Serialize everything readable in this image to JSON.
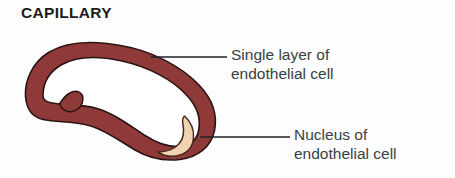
{
  "figure": {
    "title": "CAPILLARY",
    "width": 455,
    "height": 178,
    "background_color": "#fdfdfd"
  },
  "colors": {
    "wall": "#8f3a38",
    "wall_outline": "#2a1413",
    "lumen": "#ffffff",
    "nucleus": "#efd3b2",
    "nucleus_outline": "#4a2a1c",
    "leader_line": "#1d2127",
    "title_text": "#1b1b1b",
    "label_text": "#3a3f44"
  },
  "labels": {
    "single_layer": {
      "line1": "Single layer of",
      "line2": "endothelial cell"
    },
    "nucleus": {
      "line1": "Nucleus of",
      "line2": "endothelial cell"
    }
  },
  "leaders": {
    "single_layer": {
      "x1": 151,
      "y1": 57,
      "x2": 227,
      "y2": 57
    },
    "nucleus": {
      "x1": 200,
      "y1": 137,
      "x2": 290,
      "y2": 137
    }
  },
  "shapes": {
    "capillary_outer_path": "M 25.5 96.5 C 24.5 80.5 32.5 62.5 48.5 52.5 C 66.5 41.5 92.5 40.5 120.5 45.5 C 150.5 50.5 180.5 65.5 199.5 85.5 C 212.5 99.5 217.5 115.5 214.5 130.5 C 211.0 147.0 197.5 157.5 180.0 159.5 C 163.0 161.5 147.0 157.0 135.0 150.0 C 120.0 141.0 106.5 131.0 91.0 126.0 C 76.0 121.0 58.0 122.5 43.0 119.5 C 31.5 117.0 26.5 108.0 25.5 96.5 Z",
    "capillary_lumen_path": "M 43.0 95.5 C 43.0 82.5 49.5 71.5 62.0 64.5 C 77.0 56.0 99.0 56.0 122.0 61.0 C 147.0 66.5 172.0 79.0 187.0 95.5 C 197.5 107.0 201.0 119.5 198.5 131.0 C 196.5 140.5 189.5 146.0 179.0 146.5 C 167.0 147.0 155.0 142.0 145.0 135.5 C 129.0 125.0 114.0 113.5 97.0 108.5 C 84.0 104.5 70.5 105.0 59.5 104.0 C 49.0 103.0 43.0 101.5 43.0 95.5 Z",
    "capillary_notch_path": "M 59.5 104.0 C 62.0 100.0 65.0 96.0 69.0 93.5 C 73.0 91.0 77.5 90.5 80.5 93.0 C 83.0 95.0 83.5 99.0 82.0 103.5 C 80.5 107.5 77.0 110.5 72.0 111.5 C 66.5 112.5 61.5 109.5 59.5 104.0 Z",
    "nucleus_path": "M 184.5 116.0 C 190.5 121.5 194.0 129.5 193.5 137.5 C 193.0 146.0 188.0 152.5 180.0 155.0 C 172.5 157.5 164.0 156.0 157.5 152.0 C 163.5 152.0 170.5 150.5 175.5 147.0 C 181.5 142.5 184.0 135.5 183.5 129.0 C 183.0 123.5 181.0 119.0 184.5 116.0 Z"
  }
}
